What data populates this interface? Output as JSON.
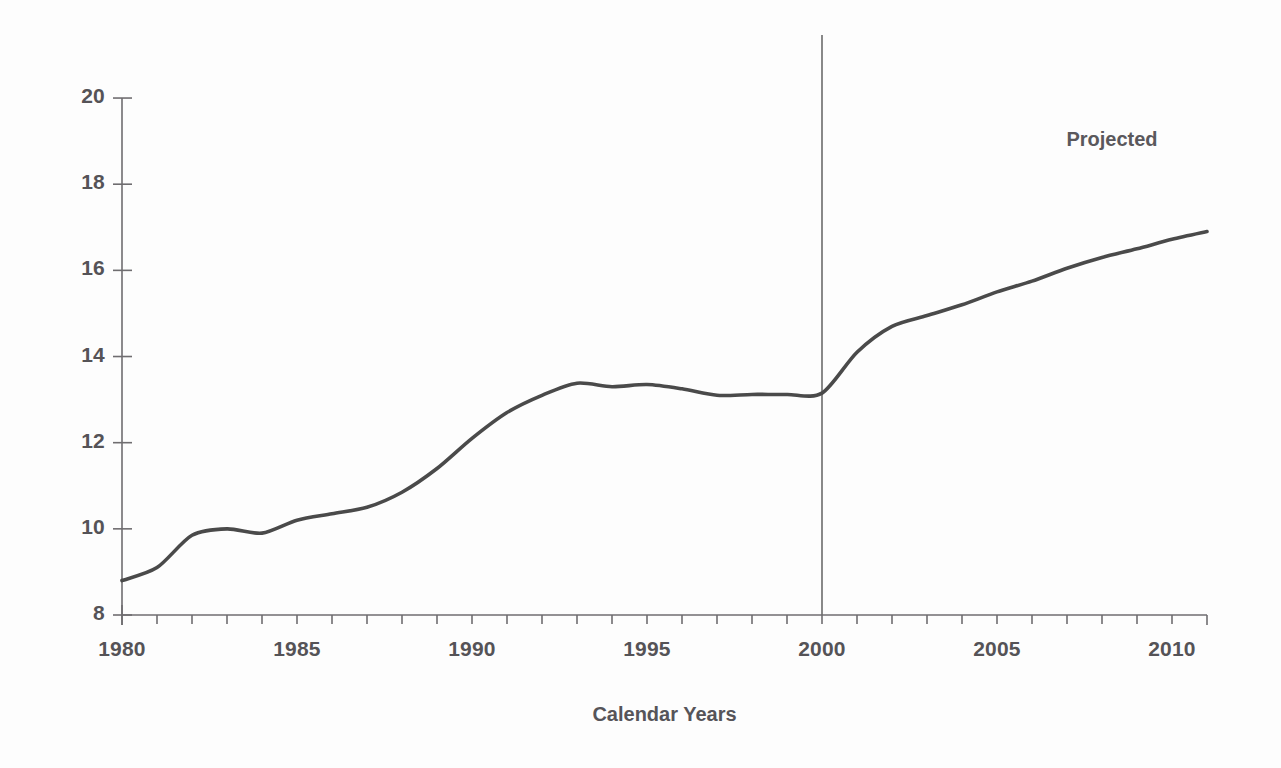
{
  "chart_data": {
    "type": "line",
    "title": "",
    "xlabel": "Calendar Years",
    "ylabel": "",
    "xlim": [
      1980,
      2011
    ],
    "ylim": [
      8,
      20
    ],
    "grid": false,
    "legend_position": "none",
    "x_tick_labels": [
      "1980",
      "1985",
      "1990",
      "1995",
      "2000",
      "2005",
      "2010"
    ],
    "x_tick_values": [
      1980,
      1985,
      1990,
      1995,
      2000,
      2005,
      2010
    ],
    "x_minor_tick_step": 1,
    "y_tick_labels": [
      "8",
      "10",
      "12",
      "14",
      "16",
      "18",
      "20"
    ],
    "y_tick_values": [
      8,
      10,
      12,
      14,
      16,
      18,
      20
    ],
    "line_color": "#4a4a4a",
    "line_width": 3.6,
    "annotations": [
      {
        "text": "Projected",
        "x": 2008,
        "y": 19.0
      }
    ],
    "reference_lines": [
      {
        "orientation": "vertical",
        "x": 2000,
        "label": "projection-divider",
        "color": "#6b6b6b"
      }
    ],
    "x": [
      1980,
      1981,
      1982,
      1983,
      1984,
      1985,
      1986,
      1987,
      1988,
      1989,
      1990,
      1991,
      1992,
      1993,
      1994,
      1995,
      1996,
      1997,
      1998,
      1999,
      2000,
      2001,
      2002,
      2003,
      2004,
      2005,
      2006,
      2007,
      2008,
      2009,
      2010,
      2011
    ],
    "values": [
      8.8,
      9.1,
      9.85,
      10.0,
      9.9,
      10.2,
      10.35,
      10.5,
      10.85,
      11.4,
      12.1,
      12.7,
      13.1,
      13.38,
      13.3,
      13.35,
      13.25,
      13.1,
      13.12,
      13.12,
      13.15,
      14.1,
      14.7,
      14.95,
      15.2,
      15.5,
      15.75,
      16.05,
      16.3,
      16.5,
      16.72,
      16.9
    ],
    "series": [
      {
        "name": "series-1",
        "values": [
          8.8,
          9.1,
          9.85,
          10.0,
          9.9,
          10.2,
          10.35,
          10.5,
          10.85,
          11.4,
          12.1,
          12.7,
          13.1,
          13.38,
          13.3,
          13.35,
          13.25,
          13.1,
          13.12,
          13.12,
          13.15,
          14.1,
          14.7,
          14.95,
          15.2,
          15.5,
          15.75,
          16.05,
          16.3,
          16.5,
          16.72,
          16.9
        ]
      }
    ]
  }
}
